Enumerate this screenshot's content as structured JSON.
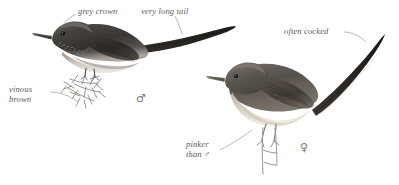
{
  "plate": {
    "title": "Bird illustration plate",
    "background_color": "#ffffff",
    "ink_color": "#5a5a58",
    "width": 399,
    "height": 185
  },
  "annotations": [
    {
      "id": "grey-crown",
      "text": "grey crown",
      "x": 78,
      "y": 9,
      "lines": [
        "grey crown"
      ]
    },
    {
      "id": "very-long-tail",
      "text": "very long tail",
      "x": 141,
      "y": 9,
      "lines": [
        "very long tail"
      ]
    },
    {
      "id": "vinous-brown",
      "text": "vinous brown",
      "x": 9,
      "y": 85,
      "lines": [
        "vinous",
        "brown"
      ]
    },
    {
      "id": "often-cocked",
      "text": "often cocked",
      "x": 284,
      "y": 26,
      "lines": [
        "often cocked"
      ]
    },
    {
      "id": "pinker-than-male",
      "text": "pinker than ♂",
      "x": 186,
      "y": 140,
      "lines": [
        "pinker",
        "than ♂"
      ]
    }
  ],
  "labels": {
    "grey_crown": "grey crown",
    "very_long_tail": "very long tail",
    "vinous": "vinous",
    "brown": "brown",
    "often_cocked": "often cocked",
    "pinker": "pinker",
    "than_male": "than ♂"
  },
  "sex_symbols": [
    {
      "id": "male-symbol",
      "glyph": "♂",
      "x": 139,
      "y": 95,
      "refers_to": "left-bird"
    },
    {
      "id": "female-symbol",
      "glyph": "♀",
      "x": 303,
      "y": 144,
      "refers_to": "right-bird"
    }
  ],
  "symbols": {
    "male": "♂",
    "female": "♀"
  },
  "birds": [
    {
      "id": "left-bird",
      "sex": "male",
      "pose": "perched on thorny twig, long tail trailing right",
      "plumage": "dark grey-brown upperparts, grey crown, white-speckled throat, pale belly"
    },
    {
      "id": "right-bird",
      "sex": "female",
      "pose": "perched on thin stem, tail cocked upward",
      "plumage": "warm brown upperparts, pale pinkish-buff underparts"
    }
  ]
}
